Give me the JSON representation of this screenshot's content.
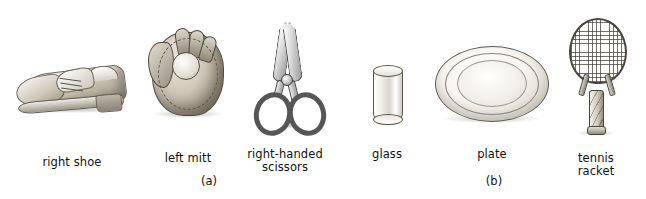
{
  "figure": {
    "background_color": "#ffffff",
    "ink_color": "#111111",
    "panels": [
      {
        "id": "a",
        "label": "(a)",
        "items": [
          {
            "name": "right-shoe",
            "caption": "right shoe"
          },
          {
            "name": "left-mitt",
            "caption": "left mitt"
          },
          {
            "name": "right-handed-scissors",
            "caption": "right-handed\nscissors"
          }
        ]
      },
      {
        "id": "b",
        "label": "(b)",
        "items": [
          {
            "name": "glass",
            "caption": "glass"
          },
          {
            "name": "plate",
            "caption": "plate"
          },
          {
            "name": "tennis-racket",
            "caption": "tennis\nracket"
          }
        ]
      }
    ]
  }
}
